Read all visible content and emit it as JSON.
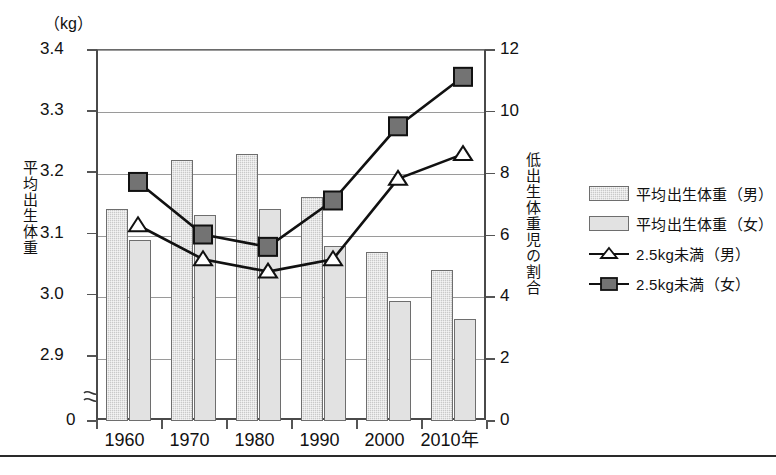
{
  "axes": {
    "left_unit": "（kg）",
    "left_title": "平均出生体重",
    "right_title": "低出生体重児の割合",
    "left_ticks": [
      "3.4",
      "3.3",
      "3.2",
      "3.1",
      "3.0",
      "2.9",
      "0"
    ],
    "right_ticks": [
      "12",
      "10",
      "8",
      "6",
      "4",
      "2",
      "0"
    ],
    "x_ticks": [
      "1960",
      "1970",
      "1980",
      "1990",
      "2000",
      "2010年"
    ],
    "break_symbol": "≈"
  },
  "legend": {
    "items": [
      {
        "label": "平均出生体重（男）",
        "marker": "bar-hatched",
        "color": "#c9c9c9"
      },
      {
        "label": "平均出生体重（女）",
        "marker": "bar-light",
        "color": "#e2e2e2"
      },
      {
        "label": "2.5kg未満（男）",
        "marker": "line-triangle-open",
        "color": "#ffffff"
      },
      {
        "label": "2.5kg未満（女）",
        "marker": "line-square-filled",
        "color": "#6e6e6e"
      }
    ]
  },
  "chart_data": {
    "type": "bar",
    "title": "",
    "xlabel": "",
    "ylabel": "平均出生体重",
    "y2label": "低出生体重児の割合",
    "categories": [
      "1960",
      "1970",
      "1980",
      "1990",
      "2000",
      "2010"
    ],
    "ylim": [
      2.85,
      3.4
    ],
    "y2lim": [
      0,
      12
    ],
    "grid": true,
    "legend_position": "right",
    "axis_break": true,
    "series": [
      {
        "name": "平均出生体重（男）",
        "unit": "kg",
        "axis": "left",
        "kind": "bar",
        "values": [
          3.14,
          3.22,
          3.23,
          3.16,
          3.07,
          3.04
        ]
      },
      {
        "name": "平均出生体重（女）",
        "unit": "kg",
        "axis": "left",
        "kind": "bar",
        "values": [
          3.09,
          3.13,
          3.14,
          3.08,
          2.99,
          2.96
        ]
      },
      {
        "name": "2.5kg未満（男）",
        "unit": "%",
        "axis": "right",
        "kind": "line",
        "values": [
          6.3,
          5.2,
          4.8,
          5.2,
          7.8,
          8.6
        ]
      },
      {
        "name": "2.5kg未満（女）",
        "unit": "%",
        "axis": "right",
        "kind": "line",
        "values": [
          7.7,
          6.0,
          5.6,
          7.1,
          9.5,
          11.1
        ]
      }
    ]
  }
}
